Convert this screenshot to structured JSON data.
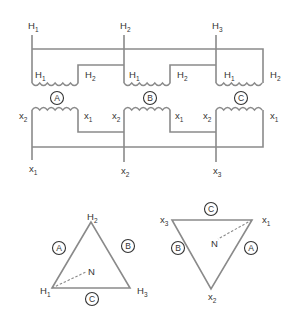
{
  "diagram": {
    "stroke_color": "#8a8a8a",
    "text_color": "#333333",
    "primary": {
      "terminals": [
        {
          "letter": "H",
          "sub": "1"
        },
        {
          "letter": "H",
          "sub": "2"
        },
        {
          "letter": "H",
          "sub": "3"
        }
      ],
      "coils": [
        {
          "phase": "A",
          "left": {
            "letter": "H",
            "sub": "1"
          },
          "right": {
            "letter": "H",
            "sub": "2"
          }
        },
        {
          "phase": "B",
          "left": {
            "letter": "H",
            "sub": "1"
          },
          "right": {
            "letter": "H",
            "sub": "2"
          }
        },
        {
          "phase": "C",
          "left": {
            "letter": "H",
            "sub": "1"
          },
          "right": {
            "letter": "H",
            "sub": "2"
          }
        }
      ]
    },
    "secondary": {
      "coils": [
        {
          "phase": "A",
          "left": {
            "letter": "x",
            "sub": "2"
          },
          "right": {
            "letter": "x",
            "sub": "1"
          }
        },
        {
          "phase": "B",
          "left": {
            "letter": "x",
            "sub": "2"
          },
          "right": {
            "letter": "x",
            "sub": "1"
          }
        },
        {
          "phase": "C",
          "left": {
            "letter": "x",
            "sub": "2"
          },
          "right": {
            "letter": "x",
            "sub": "1"
          }
        }
      ],
      "terminals": [
        {
          "letter": "x",
          "sub": "1"
        },
        {
          "letter": "x",
          "sub": "2"
        },
        {
          "letter": "x",
          "sub": "3"
        }
      ]
    },
    "primary_delta": {
      "vertices": {
        "top": {
          "letter": "H",
          "sub": "2"
        },
        "bottom_left": {
          "letter": "H",
          "sub": "1"
        },
        "bottom_right": {
          "letter": "H",
          "sub": "3"
        }
      },
      "sides": {
        "left": "A",
        "right": "B",
        "bottom": "C"
      },
      "neutral": "N"
    },
    "secondary_delta": {
      "vertices": {
        "top_left": {
          "letter": "x",
          "sub": "3"
        },
        "top_right": {
          "letter": "x",
          "sub": "1"
        },
        "bottom": {
          "letter": "x",
          "sub": "2"
        }
      },
      "sides": {
        "top": "C",
        "left": "B",
        "right": "A"
      },
      "neutral": "N"
    }
  }
}
